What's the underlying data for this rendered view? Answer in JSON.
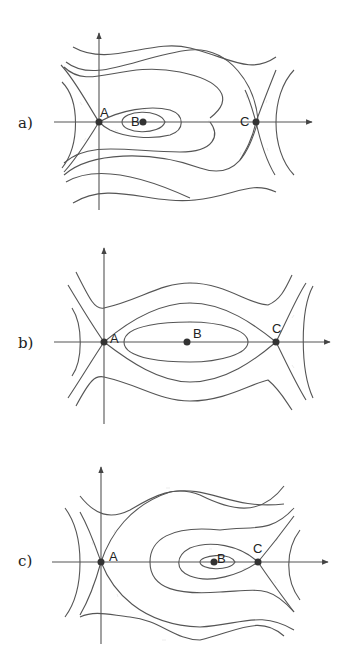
{
  "panels": [
    {
      "label": "a)",
      "points": {
        "A": "A",
        "B": "B",
        "C": "C"
      },
      "description": "Phase portrait: saddle at A, center B enclosed by closed orbits bounded by homoclinic loop from A; saddle at C"
    },
    {
      "label": "b)",
      "points": {
        "A": "A",
        "B": "B",
        "C": "C"
      },
      "description": "Phase portrait: saddles A and C joined by heteroclinic orbits enclosing center B"
    },
    {
      "label": "c)",
      "points": {
        "A": "A",
        "B": "B",
        "C": "C"
      },
      "description": "Phase portrait: saddle at A, center B enclosed by homoclinic loop from saddle C"
    }
  ],
  "colors": {
    "stroke": "#555555",
    "point": "#333333",
    "background": "#ffffff"
  }
}
